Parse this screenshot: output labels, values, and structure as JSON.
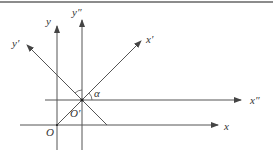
{
  "diagram": {
    "labels": {
      "y": "y",
      "y_double_prime": "y″",
      "y_prime": "y′",
      "x_prime": "x′",
      "x_double_prime": "x″",
      "x": "x",
      "alpha": "α",
      "origin": "O",
      "origin_prime": "O′"
    },
    "colors": {
      "line": "#555555",
      "text": "#333333"
    }
  }
}
